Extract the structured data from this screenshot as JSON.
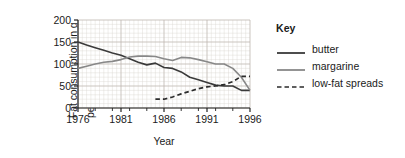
{
  "chart_data": {
    "type": "line",
    "title": "",
    "xlabel": "Year",
    "ylabel": "Fat consumption in g per person per week",
    "ylabel_line1": "Fat consumption in g",
    "ylabel_line2": "per person per week",
    "xlim": [
      1976,
      1996
    ],
    "ylim": [
      0,
      200
    ],
    "yticks": [
      0,
      50,
      100,
      150,
      200
    ],
    "xticks": [
      1976,
      1981,
      1986,
      1991,
      1996
    ],
    "grid": true,
    "legend_position": "right",
    "legend_title": "Key",
    "series": [
      {
        "name": "butter",
        "style": "solid",
        "color": "#3a3a3a",
        "x": [
          1976,
          1977,
          1978,
          1979,
          1980,
          1981,
          1982,
          1983,
          1984,
          1985,
          1986,
          1987,
          1988,
          1989,
          1990,
          1991,
          1992,
          1993,
          1994,
          1995,
          1996
        ],
        "values": [
          150,
          143,
          137,
          131,
          125,
          120,
          112,
          104,
          98,
          102,
          92,
          90,
          82,
          70,
          64,
          58,
          52,
          50,
          50,
          40,
          40
        ]
      },
      {
        "name": "margarine",
        "style": "solid",
        "color": "#888888",
        "x": [
          1976,
          1977,
          1978,
          1979,
          1980,
          1981,
          1982,
          1983,
          1984,
          1985,
          1986,
          1987,
          1988,
          1989,
          1990,
          1991,
          1992,
          1993,
          1994,
          1995,
          1996
        ],
        "values": [
          90,
          95,
          100,
          104,
          106,
          110,
          116,
          118,
          118,
          117,
          112,
          108,
          115,
          114,
          110,
          105,
          100,
          100,
          90,
          70,
          40
        ]
      },
      {
        "name": "low-fat spreads",
        "style": "dashed",
        "color": "#2b2b2b",
        "x": [
          1985,
          1986,
          1987,
          1988,
          1989,
          1990,
          1991,
          1992,
          1993,
          1994,
          1995,
          1996
        ],
        "values": [
          20,
          20,
          25,
          32,
          38,
          44,
          48,
          50,
          53,
          60,
          72,
          72
        ]
      }
    ]
  },
  "legend": {
    "title": "Key",
    "items": [
      {
        "label": "butter",
        "style": "solid",
        "color": "#3a3a3a"
      },
      {
        "label": "margarine",
        "style": "solid",
        "color": "#888888"
      },
      {
        "label": "low-fat spreads",
        "style": "dashed",
        "color": "#2b2b2b"
      }
    ]
  }
}
